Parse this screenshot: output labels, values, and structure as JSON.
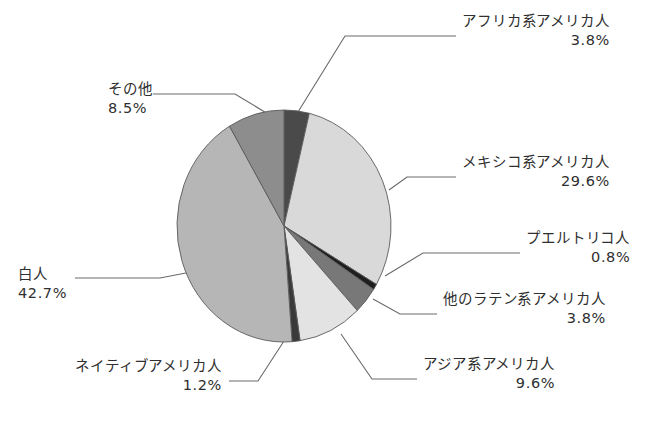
{
  "chart_data": {
    "type": "pie",
    "title": "",
    "subtitle": "",
    "xlabel": "",
    "ylabel": "",
    "legend_position": "none",
    "labels_outside": true,
    "start_angle_deg": 0,
    "direction": "clockwise",
    "total_percent": 100.0,
    "categories": [
      "アフリカ系アメリカ人",
      "メキシコ系アメリカ人",
      "プエルトリコ人",
      "他のラテン系アメリカ人",
      "アジア系アメリカ人",
      "ネイティブアメリカ人",
      "白人",
      "その他"
    ],
    "values": [
      3.8,
      29.6,
      0.8,
      3.8,
      9.6,
      1.2,
      42.7,
      8.5
    ],
    "value_labels": [
      "3.8%",
      "29.6%",
      "0.8%",
      "3.8%",
      "9.6%",
      "1.2%",
      "42.7%",
      "8.5%"
    ],
    "colors": [
      "#4a4a4a",
      "#d9d9d9",
      "#1f1f1f",
      "#787878",
      "#e3e3e3",
      "#3a3a3a",
      "#b6b6b6",
      "#8d8d8d"
    ],
    "slices": [
      {
        "name": "アフリカ系アメリカ人",
        "value": 3.8,
        "value_label": "3.8%",
        "color": "#4a4a4a"
      },
      {
        "name": "メキシコ系アメリカ人",
        "value": 29.6,
        "value_label": "29.6%",
        "color": "#d9d9d9"
      },
      {
        "name": "プエルトリコ人",
        "value": 0.8,
        "value_label": "0.8%",
        "color": "#1f1f1f"
      },
      {
        "name": "他のラテン系アメリカ人",
        "value": 3.8,
        "value_label": "3.8%",
        "color": "#787878"
      },
      {
        "name": "アジア系アメリカ人",
        "value": 9.6,
        "value_label": "9.6%",
        "color": "#e3e3e3"
      },
      {
        "name": "ネイティブアメリカ人",
        "value": 1.2,
        "value_label": "1.2%",
        "color": "#3a3a3a"
      },
      {
        "name": "白人",
        "value": 42.7,
        "value_label": "42.7%",
        "color": "#b6b6b6"
      },
      {
        "name": "その他",
        "value": 8.5,
        "value_label": "8.5%",
        "color": "#8d8d8d"
      }
    ]
  },
  "labels": {
    "african_american": {
      "name": "アフリカ系アメリカ人",
      "value": "3.8%"
    },
    "mexican_american": {
      "name": "メキシコ系アメリカ人",
      "value": "29.6%"
    },
    "puerto_rican": {
      "name": "プエルトリコ人",
      "value": "0.8%"
    },
    "other_latino": {
      "name": "他のラテン系アメリカ人",
      "value": "3.8%"
    },
    "asian_american": {
      "name": "アジア系アメリカ人",
      "value": "9.6%"
    },
    "native_american": {
      "name": "ネイティブアメリカ人",
      "value": "1.2%"
    },
    "white": {
      "name": "白人",
      "value": "42.7%"
    },
    "other": {
      "name": "その他",
      "value": "8.5%"
    }
  }
}
